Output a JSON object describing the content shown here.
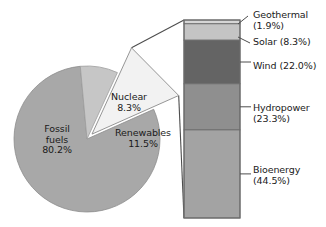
{
  "figure": {
    "background": "#ffffff",
    "text_color": "#1a1a1a"
  },
  "pie": {
    "center_x": 87,
    "center_y": 139,
    "radius": 73,
    "explode_label": "Renewables",
    "slices": [
      {
        "name": "Fossil fuels",
        "label_line1": "Fossil",
        "label_line2": "fuels",
        "value_label": "80.2%",
        "value": 80.2,
        "color": "#a8a8a8"
      },
      {
        "name": "Nuclear",
        "label_line1": "Nuclear",
        "label_line2": "",
        "value_label": "8.3%",
        "value": 8.3,
        "color": "#c6c6c6"
      },
      {
        "name": "Renewables",
        "label_line1": "Renewables",
        "label_line2": "",
        "value_label": "11.5%",
        "value": 11.5,
        "color": "#f2f2f2"
      }
    ]
  },
  "bar": {
    "x": 184,
    "y": 20,
    "width": 56,
    "height": 198,
    "border_color": "#6b6b6b",
    "segments": [
      {
        "name": "Geothermal",
        "label": "Geothermal",
        "value_label": "(1.9%)",
        "value": 1.9,
        "color": "#d6d6d6"
      },
      {
        "name": "Solar",
        "label": "Solar",
        "value_label": "(8.3%)",
        "value": 8.3,
        "color": "#c4c4c4"
      },
      {
        "name": "Wind",
        "label": "Wind",
        "value_label": "(22.0%)",
        "value": 22.0,
        "color": "#646464"
      },
      {
        "name": "Hydropower",
        "label": "Hydropower",
        "value_label": "(23.3%)",
        "value": 23.3,
        "color": "#8f8f8f"
      },
      {
        "name": "Bioenergy",
        "label": "Bioenergy",
        "value_label": "(44.5%)",
        "value": 44.5,
        "color": "#a3a3a3"
      }
    ]
  },
  "callouts": {
    "geothermal_line1": "Geothermal",
    "geothermal_line2": "(1.9%)",
    "solar_line1": "Solar (8.3%)",
    "solar_line2": "",
    "wind_line1": "Wind (22.0%)",
    "wind_line2": "",
    "hydro_line1": "Hydropower",
    "hydro_line2": "(23.3%)",
    "bio_line1": "Bioenergy",
    "bio_line2": "(44.5%)"
  },
  "chart_data": {
    "type": "pie",
    "title": "",
    "subtitle": "",
    "xlabel": "",
    "ylabel": "",
    "legend_position": "none",
    "grid": false,
    "units": "percent of total primary energy",
    "charts": [
      {
        "type": "pie",
        "name": "Global energy mix",
        "categories": [
          "Fossil fuels",
          "Nuclear",
          "Renewables"
        ],
        "values": [
          80.2,
          8.3,
          11.5
        ],
        "value_labels": [
          "80.2%",
          "8.3%",
          "11.5%"
        ],
        "colors": [
          "#a8a8a8",
          "#c6c6c6",
          "#f2f2f2"
        ],
        "exploded": [
          "Renewables"
        ],
        "start_angle_deg": -24,
        "direction": "clockwise"
      },
      {
        "type": "bar",
        "orientation": "vertical-stacked",
        "name": "Renewables breakdown",
        "parent_slice": "Renewables",
        "categories": [
          "Geothermal",
          "Solar",
          "Wind",
          "Hydropower",
          "Bioenergy"
        ],
        "values": [
          1.9,
          8.3,
          22.0,
          23.3,
          44.5
        ],
        "value_labels": [
          "(1.9%)",
          "(8.3%)",
          "(22.0%)",
          "(23.3%)",
          "(44.5%)"
        ],
        "colors": [
          "#d6d6d6",
          "#c4c4c4",
          "#646464",
          "#8f8f8f",
          "#a3a3a3"
        ],
        "stack_order": "top-to-bottom",
        "ylim": [
          0,
          100
        ],
        "total": 100.0
      }
    ]
  }
}
